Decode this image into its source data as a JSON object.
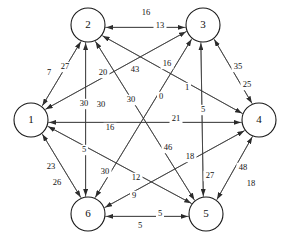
{
  "diagram": {
    "type": "directed-weighted-graph",
    "background_color": "#ffffff",
    "node_fill": "#ffffff",
    "node_stroke": "#1a1a1a",
    "edge_color": "#3a3a3a",
    "label_color": "#111111",
    "layout": "hexagon",
    "nodes": [
      {
        "id": "1",
        "label": "1",
        "cx": 31,
        "cy": 120,
        "r": 17
      },
      {
        "id": "2",
        "label": "2",
        "cx": 88,
        "cy": 25,
        "r": 17
      },
      {
        "id": "3",
        "label": "3",
        "cx": 203,
        "cy": 25,
        "r": 17
      },
      {
        "id": "4",
        "label": "4",
        "cx": 259,
        "cy": 120,
        "r": 17
      },
      {
        "id": "5",
        "label": "5",
        "cx": 206,
        "cy": 214,
        "r": 17
      },
      {
        "id": "6",
        "label": "6",
        "cx": 88,
        "cy": 214,
        "r": 17
      }
    ],
    "edges": [
      {
        "from": "3",
        "to": "2",
        "weight": "16",
        "lx": 146,
        "ly": 13
      },
      {
        "from": "2",
        "to": "3",
        "weight": "13",
        "lx": 160,
        "ly": 26
      },
      {
        "from": "2",
        "to": "1",
        "weight": "7",
        "lx": 49,
        "ly": 73
      },
      {
        "from": "1",
        "to": "2",
        "weight": "27",
        "lx": 65,
        "ly": 67
      },
      {
        "from": "3",
        "to": "4",
        "weight": "35",
        "lx": 238,
        "ly": 67
      },
      {
        "from": "4",
        "to": "3",
        "weight": "25",
        "lx": 247,
        "ly": 85
      },
      {
        "from": "1",
        "to": "6",
        "weight": "23",
        "lx": 51,
        "ly": 167
      },
      {
        "from": "6",
        "to": "1",
        "weight": "26",
        "lx": 57,
        "ly": 183
      },
      {
        "from": "4",
        "to": "5",
        "weight": "48",
        "lx": 243,
        "ly": 168
      },
      {
        "from": "5",
        "to": "4",
        "weight": "18",
        "lx": 251,
        "ly": 184
      },
      {
        "from": "5",
        "to": "6",
        "weight": "5",
        "lx": 160,
        "ly": 214
      },
      {
        "from": "6",
        "to": "5",
        "weight": "5",
        "lx": 140,
        "ly": 226
      },
      {
        "from": "4",
        "to": "1",
        "weight": "21",
        "lx": 176,
        "ly": 119
      },
      {
        "from": "1",
        "to": "4",
        "weight": "16",
        "lx": 110,
        "ly": 128
      },
      {
        "from": "6",
        "to": "2",
        "weight": "30",
        "lx": 84,
        "ly": 104
      },
      {
        "from": "2",
        "to": "6",
        "weight": "5",
        "lx": 84,
        "ly": 150
      },
      {
        "from": "5",
        "to": "3",
        "weight": "5",
        "lx": 203,
        "ly": 110
      },
      {
        "from": "3",
        "to": "5",
        "weight": "27",
        "lx": 210,
        "ly": 176
      },
      {
        "from": "6",
        "to": "3",
        "weight": "43",
        "lx": 135,
        "ly": 70
      },
      {
        "from": "3",
        "to": "6",
        "weight": "30",
        "lx": 131,
        "ly": 100
      },
      {
        "from": "5",
        "to": "2",
        "weight": "20",
        "lx": 103,
        "ly": 73
      },
      {
        "from": "2",
        "to": "5",
        "weight": "46",
        "lx": 168,
        "ly": 148
      },
      {
        "from": "4",
        "to": "2",
        "weight": "16",
        "lx": 167,
        "ly": 64
      },
      {
        "from": "2",
        "to": "4",
        "weight": "1",
        "lx": 187,
        "ly": 88
      },
      {
        "from": "1",
        "to": "3",
        "weight": "0",
        "lx": 161,
        "ly": 97
      },
      {
        "from": "3",
        "to": "1",
        "weight": "30",
        "lx": 101,
        "ly": 105
      },
      {
        "from": "1",
        "to": "5",
        "weight": "30",
        "lx": 105,
        "ly": 172
      },
      {
        "from": "5",
        "to": "1",
        "weight": "12",
        "lx": 136,
        "ly": 178
      },
      {
        "from": "4",
        "to": "6",
        "weight": "18",
        "lx": 190,
        "ly": 157
      },
      {
        "from": "6",
        "to": "4",
        "weight": "9",
        "lx": 134,
        "ly": 196
      }
    ]
  }
}
